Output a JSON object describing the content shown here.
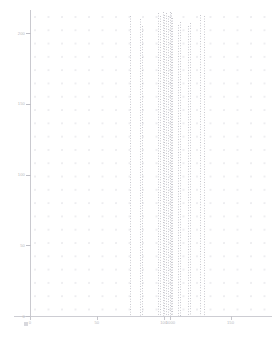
{
  "chart_data": {
    "type": "bar",
    "title": "",
    "subtitle": "",
    "xlabel": "",
    "ylabel": "",
    "grid": true,
    "legend": "none",
    "xlim": [
      0,
      178
    ],
    "ylim": [
      0,
      215
    ],
    "x_ticks": [
      {
        "value": 0,
        "label": "0"
      },
      {
        "value": 50,
        "label": "50"
      },
      {
        "value": 100,
        "label": "100"
      },
      {
        "value": 105,
        "label": "1000"
      },
      {
        "value": 150,
        "label": "150"
      }
    ],
    "y_ticks": [
      {
        "value": 0,
        "label": "0"
      },
      {
        "value": 50,
        "label": "50"
      },
      {
        "value": 100,
        "label": "100"
      },
      {
        "value": 150,
        "label": "150"
      },
      {
        "value": 200,
        "label": "200"
      }
    ],
    "x": [
      74.5,
      82.5,
      83.5,
      95.5,
      97.5,
      99.5,
      100.5,
      101.5,
      103.0,
      104.5,
      105.5,
      106.5,
      111.0,
      112.5,
      118.5,
      119.5,
      127.5,
      130.5
    ],
    "values": [
      212,
      210,
      205,
      214,
      212,
      215,
      213,
      214,
      212,
      215,
      214,
      211,
      206,
      208,
      205,
      207,
      213,
      212
    ],
    "series": [
      {
        "name": "peaks",
        "color": "#c2c2c9",
        "values": [
          212,
          210,
          205,
          214,
          212,
          215,
          213,
          214,
          212,
          215,
          214,
          211,
          206,
          208,
          205,
          207,
          213,
          212
        ]
      }
    ],
    "annotations": []
  },
  "scrollbar": {
    "orientation": "horizontal",
    "thumb_position_pct": 78
  },
  "colors": {
    "axis": "#c9c9cf",
    "tick_label": "#b9b9c0",
    "grid_dot": "#ededf0",
    "peak": "#c2c2c9",
    "scrollbar_thumb": "#c5c5cb",
    "background": "#ffffff"
  }
}
